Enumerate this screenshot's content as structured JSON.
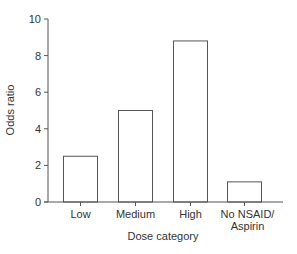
{
  "chart_data": {
    "type": "bar",
    "title": "",
    "xlabel": "Dose category",
    "ylabel": "Odds ratio",
    "categories": [
      "Low",
      "Medium",
      "High",
      "No NSAID/\nAspirin"
    ],
    "category_lines": [
      [
        "Low"
      ],
      [
        "Medium"
      ],
      [
        "High"
      ],
      [
        "No NSAID/",
        "Aspirin"
      ]
    ],
    "values": [
      2.5,
      5.0,
      8.8,
      1.1
    ],
    "ylim": [
      0,
      10
    ],
    "yticks": [
      0,
      2,
      4,
      6,
      8,
      10
    ],
    "grid": false,
    "legend": null,
    "bar_fill": "#ffffff",
    "bar_stroke": "#555555"
  }
}
